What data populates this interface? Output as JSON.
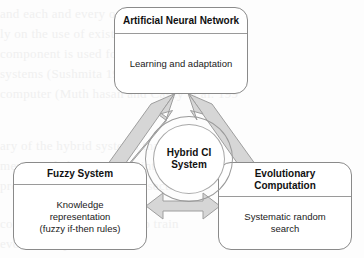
{
  "diagram": {
    "type": "hub-and-spoke concept diagram",
    "hub": {
      "name": "hybrid-ci-system",
      "label_line1": "Hybrid CI",
      "label_line2": "System",
      "shape": "double-circle"
    },
    "nodes": [
      {
        "id": "artificial-neural-network",
        "title_line1": "Artificial Neural",
        "title_line2": "Network",
        "body_line1": "Learning and adaptation",
        "body_line2": "",
        "body_line3": ""
      },
      {
        "id": "fuzzy-system",
        "title_line1": "Fuzzy System",
        "title_line2": "",
        "body_line1": "Knowledge",
        "body_line2": "representation",
        "body_line3": "(fuzzy if-then rules)"
      },
      {
        "id": "evolutionary-computation",
        "title_line1": "Evolutionary",
        "title_line2": "Computation",
        "body_line1": "Systematic random",
        "body_line2": "search",
        "body_line3": ""
      }
    ],
    "connectors": [
      {
        "id": "fuzzy-to-ann",
        "from": "fuzzy-system",
        "to": "artificial-neural-network",
        "style": "double-headed-block-arrow",
        "direction": "diagonal-up-right"
      },
      {
        "id": "evolutionary-to-ann",
        "from": "evolutionary-computation",
        "to": "artificial-neural-network",
        "style": "double-headed-block-arrow",
        "direction": "diagonal-up-left"
      },
      {
        "id": "fuzzy-to-evolutionary",
        "from": "fuzzy-system",
        "to": "evolutionary-computation",
        "style": "double-headed-block-arrow",
        "direction": "horizontal"
      }
    ]
  },
  "colors": {
    "page_background": "#fdfdfd",
    "box_border": "#8a8a8a",
    "box_fill": "#ffffff",
    "arrow_fill": "#d4d4d4",
    "arrow_stroke": "#9b9b9b",
    "text": "#111111",
    "bleed_text": "#f0f0f0"
  },
  "background_bleed": {
    "line1": "and each and every one (1,2,3) can be",
    "line2": "ly on the use of existing building",
    "line3": "component is used for knowledge discov",
    "line4": "systems (Sushmita 1997), and  was implem",
    "line5": "computer (Muth hasan and Casey et al. 199",
    "line6": "ary of the hybrid systems that have been",
    "line7": "mentioned above and the intelligent",
    "line8": "presented in the following sections",
    "line9": "computation can be used to train",
    "line10": "evolve fuzzy rules for the"
  }
}
